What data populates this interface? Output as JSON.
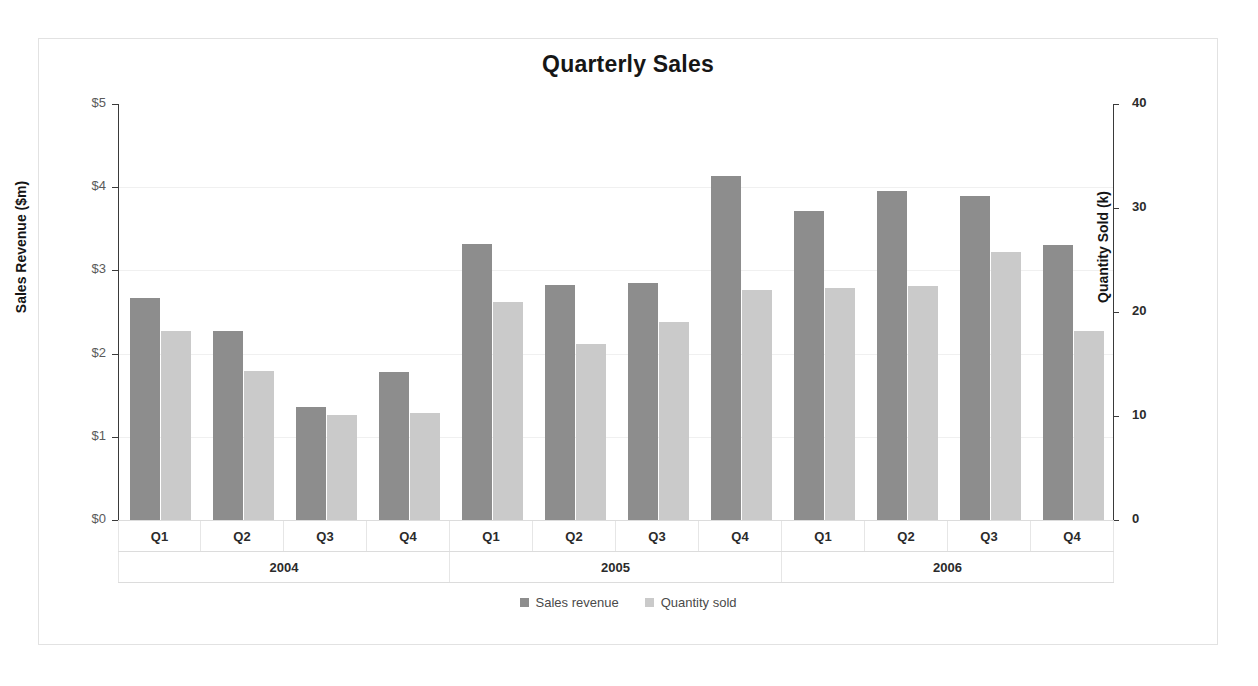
{
  "chart_data": {
    "type": "bar",
    "title": "Quarterly Sales",
    "xlabel": "",
    "ylabel": "Sales Revenue ($m)",
    "y2label": "Quantity Sold (k)",
    "ylim": [
      0,
      5
    ],
    "y2lim": [
      0,
      40
    ],
    "grid": true,
    "legend_position": "bottom",
    "y_ticks": [
      "$0",
      "$1",
      "$2",
      "$3",
      "$4",
      "$5"
    ],
    "y_tick_values": [
      0,
      1,
      2,
      3,
      4,
      5
    ],
    "y2_ticks": [
      "0",
      "10",
      "20",
      "30",
      "40"
    ],
    "y2_tick_values": [
      0,
      10,
      20,
      30,
      40
    ],
    "categories": [
      "Q1",
      "Q2",
      "Q3",
      "Q4",
      "Q1",
      "Q2",
      "Q3",
      "Q4",
      "Q1",
      "Q2",
      "Q3",
      "Q4"
    ],
    "groups": [
      {
        "label": "2004",
        "span": 4
      },
      {
        "label": "2005",
        "span": 4
      },
      {
        "label": "2006",
        "span": 4
      }
    ],
    "series": [
      {
        "name": "Sales revenue",
        "axis": "left",
        "color": "#8d8d8d",
        "unit": "$m",
        "values": [
          2.67,
          2.27,
          1.36,
          1.78,
          3.32,
          2.82,
          2.85,
          4.14,
          3.71,
          3.96,
          3.9,
          3.31
        ]
      },
      {
        "name": "Quantity sold",
        "axis": "right",
        "color": "#cacaca",
        "unit": "k",
        "values": [
          18.2,
          14.3,
          10.1,
          10.3,
          21.0,
          16.9,
          19.0,
          22.1,
          22.3,
          22.5,
          25.8,
          18.2
        ]
      }
    ]
  },
  "legend": {
    "items": [
      {
        "label": "Sales revenue",
        "key": "revenue"
      },
      {
        "label": "Quantity sold",
        "key": "quantity"
      }
    ]
  },
  "colors": {
    "revenue": "#8d8d8d",
    "quantity": "#cacaca",
    "axis": "#3a3a3a",
    "frame": "#e2e2e2",
    "grid": "#f0f0f0"
  }
}
